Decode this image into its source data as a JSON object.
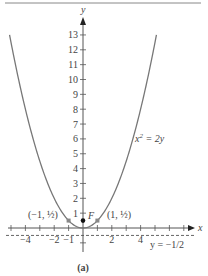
{
  "chart_data": {
    "type": "line",
    "title": "",
    "caption": "(a)",
    "equation_label": "x² = 2y",
    "directrix_label": "y = −1/2",
    "xlabel": "x",
    "ylabel": "y",
    "xlim": [
      -5.5,
      7.5
    ],
    "ylim": [
      -1.5,
      13.5
    ],
    "x_tick_labels": [
      "−4",
      "−2",
      "−1",
      "2",
      "4"
    ],
    "y_tick_labels": [
      "1",
      "2",
      "3",
      "4",
      "5",
      "6",
      "7",
      "8",
      "9",
      "10",
      "11",
      "12",
      "13"
    ],
    "grid": false,
    "series": [
      {
        "name": "x² = 2y",
        "function": "y = x^2/2",
        "style": "solid"
      },
      {
        "name": "directrix y = -1/2",
        "y": -0.5,
        "style": "dashed"
      }
    ],
    "points": [
      {
        "label": "F",
        "x": 0,
        "y": 0.5,
        "marker": "filled-circle"
      },
      {
        "label": "(−1, 1/2)",
        "x": -1,
        "y": 0.5,
        "marker": "square"
      },
      {
        "label": "(1, 1/2)",
        "x": 1,
        "y": 0.5,
        "marker": "square"
      }
    ]
  },
  "labels": {
    "caption": "(a)",
    "x_axis": "x",
    "y_axis": "y",
    "focus": "F",
    "point_left": "(−1, ½)",
    "point_right": "(1, ½)"
  }
}
